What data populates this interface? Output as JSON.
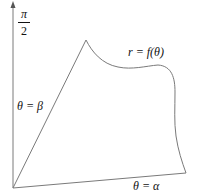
{
  "diagram": {
    "axis_label": {
      "numerator": "π",
      "denominator": "2"
    },
    "labels": {
      "ray_beta": "θ = β",
      "curve": "r = f(θ)",
      "ray_alpha": "θ = α"
    },
    "colors": {
      "stroke": "#7a7a7a",
      "text": "#111111",
      "background": "#ffffff"
    },
    "geometry": {
      "origin": [
        13,
        188
      ],
      "axis_top": [
        13,
        3
      ],
      "ray_beta_end": [
        86,
        40
      ],
      "ray_alpha_end": [
        186,
        173
      ]
    }
  }
}
